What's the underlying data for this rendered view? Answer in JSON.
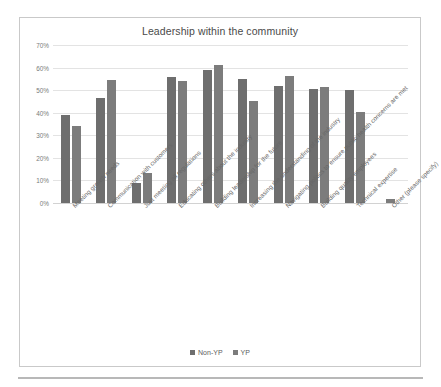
{
  "chart_data": {
    "type": "bar",
    "title": "Leadership within the community",
    "xlabel": "",
    "ylabel": "",
    "ylim": [
      0,
      70
    ],
    "ytick_labels": [
      "70%",
      "60%",
      "50%",
      "40%",
      "30%",
      "20%",
      "10%",
      "0%"
    ],
    "ytick_values": [
      70,
      60,
      50,
      40,
      30,
      20,
      10,
      0
    ],
    "grid": true,
    "legend_position": "bottom",
    "categories": [
      "Meeting growth needs",
      "Communication with customers",
      "Just meeting all regulations",
      "Educating others about the industry",
      "Building leadership for the future",
      "Increasing the understanding of the industry",
      "Navigating politics to ensure public health concerns are met",
      "Building quality employees",
      "Technical expertise",
      "Other (please specify)"
    ],
    "series": [
      {
        "name": "Non-YP",
        "color": "#6e6e6e",
        "values": [
          39,
          46.5,
          8.8,
          56,
          59,
          55,
          52,
          50.3,
          50,
          0
        ]
      },
      {
        "name": "YP",
        "color": "#7c7c7c",
        "values": [
          34,
          54.3,
          13.5,
          54,
          61,
          45,
          56.3,
          51.3,
          40.2,
          2
        ]
      }
    ]
  },
  "legend": {
    "items": [
      {
        "label": "Non-YP"
      },
      {
        "label": "YP"
      }
    ]
  }
}
